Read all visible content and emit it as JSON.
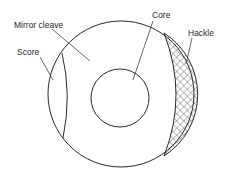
{
  "diagram": {
    "labels": {
      "mirror_cleave": "Mirror cleave",
      "score": "Score",
      "core": "Core",
      "hackle": "Hackle"
    },
    "colors": {
      "stroke": "#2a2a2a",
      "background": "#ffffff"
    }
  }
}
